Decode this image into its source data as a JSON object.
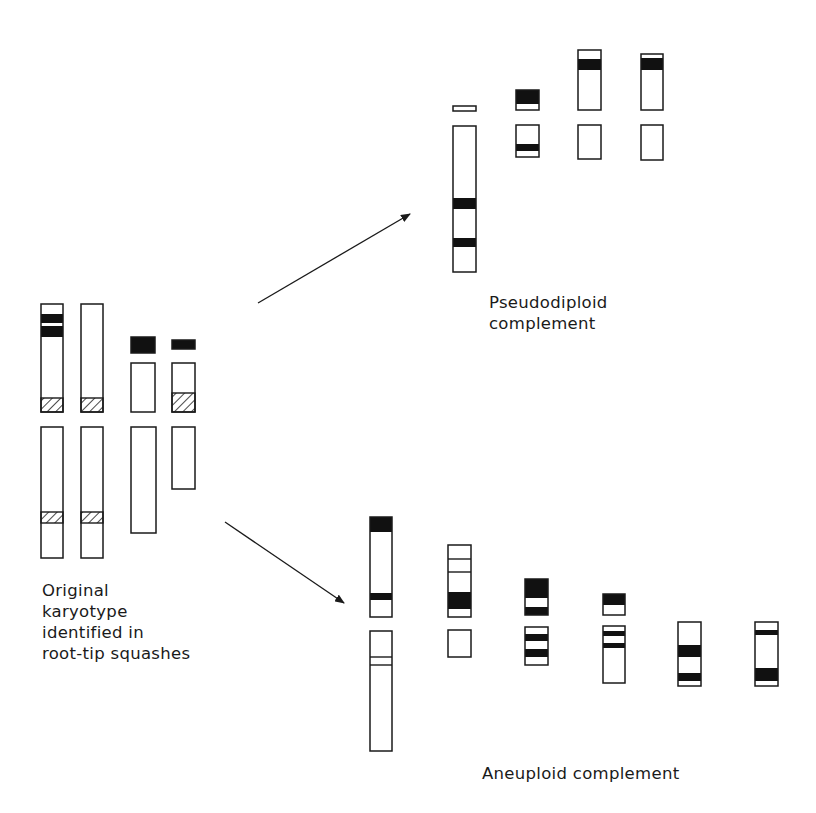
{
  "labels": {
    "original": [
      "Original",
      "karyotype",
      "identified in",
      "root-tip squashes"
    ],
    "pseudodiploid": [
      "Pseudodiploid",
      "complement"
    ],
    "aneuploid": [
      "Aneuploid complement"
    ]
  },
  "colors": {
    "stroke": "#1a1a1a",
    "band": "#111111",
    "background": "#ffffff"
  },
  "arrows": [
    {
      "name": "arrow-to-pseudodiploid",
      "x1": 258,
      "y1": 303,
      "x2": 410,
      "y2": 214
    },
    {
      "name": "arrow-to-aneuploid",
      "x1": 225,
      "y1": 522,
      "x2": 344,
      "y2": 603
    }
  ],
  "groups": [
    {
      "name": "original-karyotype",
      "segments": [
        {
          "x": 41,
          "y": 304,
          "w": 22,
          "h": 108,
          "bands": [
            {
              "y": 314,
              "h": 9,
              "t": "black"
            },
            {
              "y": 326,
              "h": 11,
              "t": "black"
            },
            {
              "y": 398,
              "h": 14,
              "t": "hatch"
            }
          ]
        },
        {
          "x": 41,
          "y": 427,
          "w": 22,
          "h": 131,
          "bands": [
            {
              "y": 512,
              "h": 11,
              "t": "hatch"
            }
          ]
        },
        {
          "x": 81,
          "y": 304,
          "w": 22,
          "h": 108,
          "bands": [
            {
              "y": 398,
              "h": 14,
              "t": "hatch"
            }
          ]
        },
        {
          "x": 81,
          "y": 427,
          "w": 22,
          "h": 131,
          "bands": [
            {
              "y": 512,
              "h": 11,
              "t": "hatch"
            }
          ]
        },
        {
          "x": 131,
          "y": 337,
          "w": 24,
          "h": 16,
          "bands": [
            {
              "y": 337,
              "h": 16,
              "t": "black"
            }
          ]
        },
        {
          "x": 131,
          "y": 363,
          "w": 24,
          "h": 49,
          "bands": []
        },
        {
          "x": 131,
          "y": 427,
          "w": 25,
          "h": 106,
          "bands": []
        },
        {
          "x": 172,
          "y": 340,
          "w": 23,
          "h": 9,
          "bands": [
            {
              "y": 340,
              "h": 9,
              "t": "black"
            }
          ]
        },
        {
          "x": 172,
          "y": 363,
          "w": 23,
          "h": 49,
          "bands": [
            {
              "y": 393,
              "h": 19,
              "t": "hatch"
            }
          ]
        },
        {
          "x": 172,
          "y": 427,
          "w": 23,
          "h": 62,
          "bands": []
        }
      ]
    },
    {
      "name": "pseudodiploid-complement",
      "segments": [
        {
          "x": 453,
          "y": 106,
          "w": 23,
          "h": 5,
          "bands": []
        },
        {
          "x": 453,
          "y": 126,
          "w": 23,
          "h": 146,
          "bands": [
            {
              "y": 198,
              "h": 11,
              "t": "black"
            },
            {
              "y": 238,
              "h": 9,
              "t": "black"
            }
          ]
        },
        {
          "x": 516,
          "y": 90,
          "w": 23,
          "h": 20,
          "bands": [
            {
              "y": 90,
              "h": 14,
              "t": "black"
            }
          ]
        },
        {
          "x": 516,
          "y": 125,
          "w": 23,
          "h": 32,
          "bands": [
            {
              "y": 144,
              "h": 7,
              "t": "black"
            }
          ]
        },
        {
          "x": 578,
          "y": 50,
          "w": 23,
          "h": 60,
          "bands": [
            {
              "y": 59,
              "h": 11,
              "t": "black"
            }
          ]
        },
        {
          "x": 578,
          "y": 125,
          "w": 23,
          "h": 34,
          "bands": []
        },
        {
          "x": 641,
          "y": 54,
          "w": 22,
          "h": 56,
          "bands": [
            {
              "y": 58,
              "h": 12,
              "t": "black"
            }
          ]
        },
        {
          "x": 641,
          "y": 125,
          "w": 22,
          "h": 35,
          "bands": []
        }
      ]
    },
    {
      "name": "aneuploid-complement",
      "segments": [
        {
          "x": 370,
          "y": 517,
          "w": 22,
          "h": 100,
          "bands": [
            {
              "y": 517,
              "h": 15,
              "t": "black"
            },
            {
              "y": 593,
              "h": 7,
              "t": "black"
            }
          ]
        },
        {
          "x": 370,
          "y": 631,
          "w": 22,
          "h": 120,
          "bands": [
            {
              "y": 657,
              "h": 0,
              "t": "line"
            },
            {
              "y": 665,
              "h": 0,
              "t": "line"
            }
          ]
        },
        {
          "x": 448,
          "y": 545,
          "w": 23,
          "h": 72,
          "bands": [
            {
              "y": 559,
              "h": 0,
              "t": "line"
            },
            {
              "y": 572,
              "h": 0,
              "t": "line"
            },
            {
              "y": 592,
              "h": 17,
              "t": "black"
            }
          ]
        },
        {
          "x": 448,
          "y": 630,
          "w": 23,
          "h": 27,
          "bands": []
        },
        {
          "x": 525,
          "y": 579,
          "w": 23,
          "h": 36,
          "bands": [
            {
              "y": 579,
              "h": 19,
              "t": "black"
            },
            {
              "y": 607,
              "h": 8,
              "t": "black"
            }
          ]
        },
        {
          "x": 525,
          "y": 627,
          "w": 23,
          "h": 38,
          "bands": [
            {
              "y": 634,
              "h": 7,
              "t": "black"
            },
            {
              "y": 649,
              "h": 8,
              "t": "black"
            }
          ]
        },
        {
          "x": 603,
          "y": 594,
          "w": 22,
          "h": 21,
          "bands": [
            {
              "y": 594,
              "h": 11,
              "t": "black"
            }
          ]
        },
        {
          "x": 603,
          "y": 626,
          "w": 22,
          "h": 57,
          "bands": [
            {
              "y": 631,
              "h": 5,
              "t": "black"
            },
            {
              "y": 643,
              "h": 5,
              "t": "black"
            }
          ]
        },
        {
          "x": 678,
          "y": 622,
          "w": 23,
          "h": 64,
          "bands": [
            {
              "y": 645,
              "h": 12,
              "t": "black"
            },
            {
              "y": 673,
              "h": 8,
              "t": "black"
            }
          ]
        },
        {
          "x": 755,
          "y": 622,
          "w": 23,
          "h": 64,
          "bands": [
            {
              "y": 630,
              "h": 5,
              "t": "black"
            },
            {
              "y": 668,
              "h": 13,
              "t": "black"
            }
          ]
        }
      ]
    }
  ]
}
